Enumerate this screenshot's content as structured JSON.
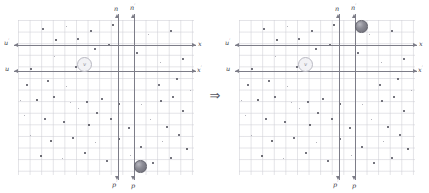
{
  "figure": {
    "transform_arrow": "⇒",
    "colors": {
      "axis": "#7d7d88",
      "grid": "#cdcdd4",
      "star": "#5a5a64",
      "particle_fill": "#8d8d96",
      "observer_stroke": "#b9b9c2",
      "label": "#3c3c44",
      "background": "#ffffff"
    }
  },
  "panels": [
    {
      "id": "left",
      "name": "unprimed-frame-panel",
      "axes": [
        {
          "name": "u-prime-axis",
          "label": "u",
          "prime": "′",
          "orientation": "horizontal",
          "direction": "left"
        },
        {
          "name": "x-axis",
          "label": "x",
          "prime": "",
          "orientation": "horizontal",
          "direction": "right"
        },
        {
          "name": "u-axis",
          "label": "u",
          "prime": "",
          "orientation": "horizontal",
          "direction": "left"
        },
        {
          "name": "x-prime-axis",
          "label": "x",
          "prime": "′",
          "orientation": "horizontal",
          "direction": "right"
        },
        {
          "name": "n-axis",
          "label": "n",
          "prime": "",
          "orientation": "vertical",
          "direction": "up"
        },
        {
          "name": "n-prime-axis",
          "label": "n",
          "prime": "′",
          "orientation": "vertical",
          "direction": "up"
        },
        {
          "name": "p-prime-axis",
          "label": "p",
          "prime": "′",
          "orientation": "vertical",
          "direction": "down"
        },
        {
          "name": "p-axis",
          "label": "p",
          "prime": "",
          "orientation": "vertical",
          "direction": "down"
        }
      ],
      "observer": {
        "label": "v"
      },
      "particle": {
        "position": "bottom"
      }
    },
    {
      "id": "right",
      "name": "primed-frame-panel",
      "axes": [
        {
          "name": "u-prime-axis",
          "label": "u",
          "prime": "′",
          "orientation": "horizontal",
          "direction": "left"
        },
        {
          "name": "x-axis",
          "label": "x",
          "prime": "",
          "orientation": "horizontal",
          "direction": "right"
        },
        {
          "name": "u-axis",
          "label": "u",
          "prime": "",
          "orientation": "horizontal",
          "direction": "left"
        },
        {
          "name": "x-prime-axis",
          "label": "x",
          "prime": "′",
          "orientation": "horizontal",
          "direction": "right"
        },
        {
          "name": "n-axis",
          "label": "n",
          "prime": "",
          "orientation": "vertical",
          "direction": "up"
        },
        {
          "name": "n-prime-axis",
          "label": "n",
          "prime": "′",
          "orientation": "vertical",
          "direction": "up"
        },
        {
          "name": "p-prime-axis",
          "label": "p",
          "prime": "′",
          "orientation": "vertical",
          "direction": "down"
        },
        {
          "name": "p-axis",
          "label": "p",
          "prime": "",
          "orientation": "vertical",
          "direction": "down"
        }
      ],
      "observer": {
        "label": "v"
      },
      "particle": {
        "position": "top"
      }
    }
  ],
  "stars": {
    "left": [
      [
        55,
        39
      ],
      [
        77,
        38
      ],
      [
        94,
        48
      ],
      [
        54,
        56
      ],
      [
        30,
        68
      ],
      [
        75,
        66
      ],
      [
        20,
        100
      ],
      [
        36,
        99
      ],
      [
        53,
        96
      ],
      [
        70,
        102
      ],
      [
        86,
        101
      ],
      [
        101,
        98
      ],
      [
        78,
        108
      ],
      [
        96,
        112
      ],
      [
        118,
        103
      ],
      [
        141,
        104
      ],
      [
        160,
        100
      ],
      [
        172,
        96
      ],
      [
        24,
        115
      ],
      [
        44,
        118
      ],
      [
        63,
        121
      ],
      [
        88,
        124
      ],
      [
        110,
        118
      ],
      [
        128,
        127
      ],
      [
        150,
        119
      ],
      [
        166,
        126
      ],
      [
        182,
        110
      ],
      [
        30,
        135
      ],
      [
        50,
        140
      ],
      [
        72,
        137
      ],
      [
        95,
        142
      ],
      [
        118,
        138
      ],
      [
        140,
        146
      ],
      [
        162,
        141
      ],
      [
        178,
        134
      ],
      [
        40,
        155
      ],
      [
        62,
        158
      ],
      [
        84,
        152
      ],
      [
        106,
        160
      ],
      [
        130,
        155
      ],
      [
        152,
        162
      ],
      [
        170,
        157
      ],
      [
        186,
        148
      ],
      [
        26,
        84
      ],
      [
        47,
        80
      ],
      [
        66,
        86
      ],
      [
        158,
        84
      ],
      [
        176,
        78
      ],
      [
        190,
        90
      ],
      [
        108,
        44
      ],
      [
        136,
        52
      ],
      [
        160,
        62
      ],
      [
        182,
        58
      ],
      [
        42,
        28
      ],
      [
        66,
        26
      ],
      [
        90,
        30
      ],
      [
        112,
        24
      ],
      [
        148,
        34
      ],
      [
        170,
        30
      ]
    ],
    "right": [
      [
        55,
        39
      ],
      [
        77,
        38
      ],
      [
        94,
        48
      ],
      [
        54,
        56
      ],
      [
        30,
        68
      ],
      [
        75,
        66
      ],
      [
        20,
        100
      ],
      [
        36,
        99
      ],
      [
        53,
        96
      ],
      [
        70,
        102
      ],
      [
        86,
        101
      ],
      [
        101,
        98
      ],
      [
        78,
        108
      ],
      [
        96,
        112
      ],
      [
        118,
        103
      ],
      [
        141,
        104
      ],
      [
        160,
        100
      ],
      [
        172,
        96
      ],
      [
        24,
        115
      ],
      [
        44,
        118
      ],
      [
        63,
        121
      ],
      [
        88,
        124
      ],
      [
        110,
        118
      ],
      [
        128,
        127
      ],
      [
        150,
        119
      ],
      [
        166,
        126
      ],
      [
        182,
        110
      ],
      [
        30,
        135
      ],
      [
        50,
        140
      ],
      [
        72,
        137
      ],
      [
        95,
        142
      ],
      [
        118,
        138
      ],
      [
        140,
        146
      ],
      [
        162,
        141
      ],
      [
        178,
        134
      ],
      [
        40,
        155
      ],
      [
        62,
        158
      ],
      [
        84,
        152
      ],
      [
        106,
        160
      ],
      [
        130,
        155
      ],
      [
        152,
        162
      ],
      [
        170,
        157
      ],
      [
        186,
        148
      ],
      [
        26,
        84
      ],
      [
        47,
        80
      ],
      [
        66,
        86
      ],
      [
        158,
        84
      ],
      [
        176,
        78
      ],
      [
        190,
        90
      ],
      [
        108,
        44
      ],
      [
        136,
        52
      ],
      [
        160,
        62
      ],
      [
        182,
        58
      ],
      [
        42,
        28
      ],
      [
        66,
        26
      ],
      [
        90,
        30
      ],
      [
        112,
        24
      ],
      [
        148,
        34
      ],
      [
        170,
        30
      ]
    ]
  }
}
